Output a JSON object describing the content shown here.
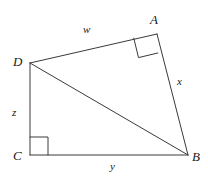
{
  "figure": {
    "type": "geometry-diagram",
    "background_color": "#ffffff",
    "stroke_color": "#3a3a3a",
    "stroke_width": 1,
    "vertices": [
      {
        "name": "A",
        "label": "A",
        "x": 157,
        "y": 34,
        "label_x": 150,
        "label_y": 13
      },
      {
        "name": "B",
        "label": "B",
        "x": 188,
        "y": 155,
        "label_x": 192,
        "label_y": 150
      },
      {
        "name": "C",
        "label": "C",
        "x": 30,
        "y": 155,
        "label_x": 13,
        "label_y": 149
      },
      {
        "name": "D",
        "label": "D",
        "x": 30,
        "y": 63,
        "label_x": 13,
        "label_y": 55
      }
    ],
    "segments": [
      {
        "name": "DA",
        "from": "D",
        "to": "A",
        "side_label": "w"
      },
      {
        "name": "AB",
        "from": "A",
        "to": "B",
        "side_label": "x"
      },
      {
        "name": "DC",
        "from": "D",
        "to": "C",
        "side_label": "z"
      },
      {
        "name": "CB",
        "from": "C",
        "to": "B",
        "side_label": "y"
      },
      {
        "name": "DB",
        "from": "D",
        "to": "B",
        "side_label": ""
      }
    ],
    "side_labels": [
      {
        "name": "w",
        "label": "w",
        "segment": "DA",
        "x": 83,
        "y": 24
      },
      {
        "name": "x",
        "label": "x",
        "segment": "AB",
        "x": 177,
        "y": 76
      },
      {
        "name": "z",
        "label": "z",
        "segment": "DC",
        "x": 12,
        "y": 107
      },
      {
        "name": "y",
        "label": "y",
        "segment": "CB",
        "x": 110,
        "y": 161
      }
    ],
    "right_angle_marks": [
      {
        "name": "right-angle-at-A",
        "at_vertex": "A",
        "size": 19,
        "rotated": true
      },
      {
        "name": "right-angle-at-C",
        "at_vertex": "C",
        "size": 18,
        "rotated": false
      }
    ]
  }
}
